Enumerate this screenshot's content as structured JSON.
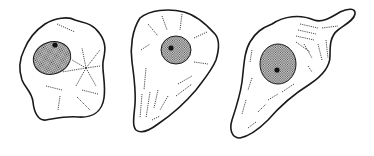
{
  "figure": {
    "stroke_color": "#1a1a1a",
    "background": "#ffffff",
    "cells": [
      {
        "label": "cell-1",
        "shape": "irregular-polygonal"
      },
      {
        "label": "cell-2",
        "shape": "triangular-tapered"
      },
      {
        "label": "cell-3",
        "shape": "elongated-with-process"
      }
    ]
  }
}
